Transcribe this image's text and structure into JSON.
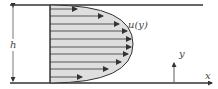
{
  "diagram": {
    "labels": {
      "height": "h",
      "velocity": "u(y)",
      "y_axis": "y",
      "x_axis": "x"
    },
    "colors": {
      "lines": "#333333",
      "profile_fill": "#d9d9d9",
      "text": "#444444"
    },
    "profile": {
      "arrow_count": 10,
      "shape": "parabolic"
    }
  }
}
